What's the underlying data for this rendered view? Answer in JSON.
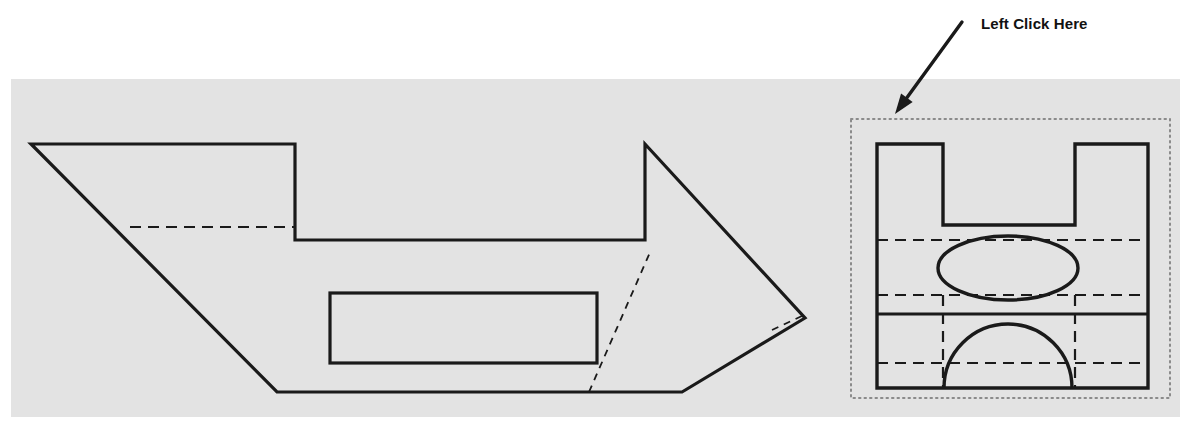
{
  "canvas": {
    "width": 1192,
    "height": 439,
    "background_color": "#ffffff"
  },
  "annotation": {
    "label": "Left Click Here",
    "label_color": "#111111",
    "arrow_color": "#1a1a1a",
    "arrow_start": {
      "x": 962,
      "y": 22
    },
    "arrow_end": {
      "x": 895,
      "y": 114
    },
    "arrow_head_size": 13
  },
  "drawing_panel": {
    "name": "cad-drawing-panel",
    "fill_color": "#e3e3e3",
    "x": 11,
    "y": 79,
    "width": 1169,
    "height": 338
  },
  "line_style": {
    "solid_color": "#1a1a1a",
    "solid_width": 3.2,
    "hidden_color": "#1a1a1a",
    "hidden_width": 2.2,
    "hidden_dash": "11,7",
    "fine_dash": "7,6",
    "fine_width": 1.8
  },
  "left_view": {
    "name": "front-view-profile",
    "outline_points": "31,144 295,144 295,240 645,240 645,144 805,318 682,392 277,392",
    "hidden_line_horizontal": {
      "x1": 130,
      "y1": 227,
      "x2": 295,
      "y2": 227
    },
    "hidden_line_diagonal": {
      "x1": 589,
      "y1": 392,
      "x2": 651,
      "y2": 250
    },
    "hidden_line_tip": {
      "x1": 772,
      "y1": 330,
      "x2": 802,
      "y2": 316
    },
    "inner_rectangle": {
      "x": 330,
      "y": 293,
      "width": 267,
      "height": 70
    }
  },
  "right_view": {
    "name": "end-view-detail",
    "selection_box": {
      "x": 851,
      "y": 119,
      "width": 319,
      "height": 279,
      "border_color": "#8a8a8a",
      "border_style": "dotted"
    },
    "body_outline": "877,144 943,144 943,225 1075,225 1075,144 1148,144 1148,388 877,388",
    "solid_divider": {
      "x1": 877,
      "y1": 314,
      "x2": 1148,
      "y2": 314
    },
    "hidden_horizontal_lines": [
      {
        "x1": 877,
        "y1": 240,
        "x2": 1148,
        "y2": 240
      },
      {
        "x1": 877,
        "y1": 295,
        "x2": 1148,
        "y2": 295
      },
      {
        "x1": 877,
        "y1": 363,
        "x2": 1148,
        "y2": 363
      }
    ],
    "hidden_vertical_lines": [
      {
        "x1": 943,
        "y1": 295,
        "x2": 943,
        "y2": 388
      },
      {
        "x1": 1075,
        "y1": 295,
        "x2": 1075,
        "y2": 388
      }
    ],
    "ellipse": {
      "cx": 1008,
      "cy": 268,
      "rx": 70,
      "ry": 32
    },
    "semicircle": {
      "cx": 1008,
      "cy": 388,
      "r": 64
    }
  }
}
